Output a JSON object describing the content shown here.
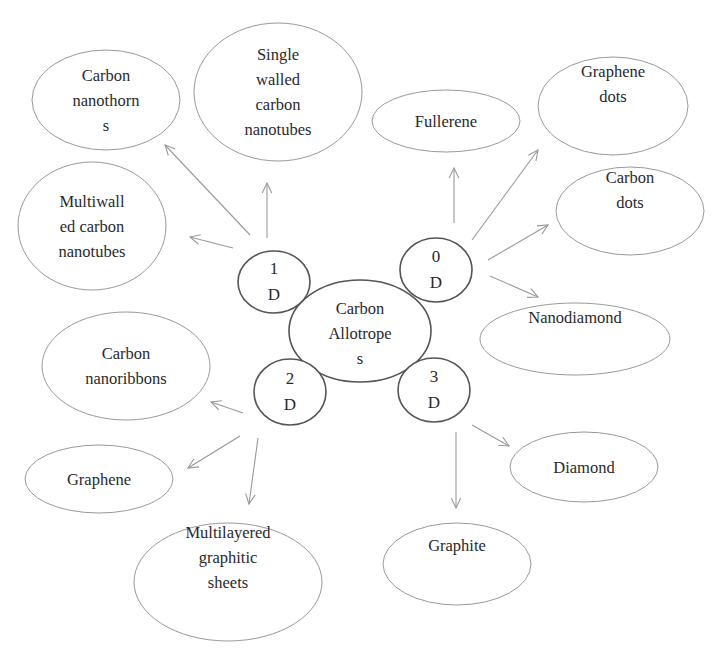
{
  "diagram": {
    "center": {
      "id": "carbon-allotropes",
      "lines": [
        "Carbon",
        "Allotrope",
        "s"
      ],
      "ellipse": {
        "cx": 360,
        "cy": 331,
        "rx": 71,
        "ry": 51
      }
    },
    "dimensions": [
      {
        "id": "1d",
        "lines": [
          "1",
          "D"
        ],
        "ellipse": {
          "cx": 274,
          "cy": 282,
          "rx": 36,
          "ry": 31
        }
      },
      {
        "id": "0d",
        "lines": [
          "0",
          "D"
        ],
        "ellipse": {
          "cx": 436,
          "cy": 270,
          "rx": 36,
          "ry": 32
        }
      },
      {
        "id": "2d",
        "lines": [
          "2",
          "D"
        ],
        "ellipse": {
          "cx": 290,
          "cy": 392,
          "rx": 36,
          "ry": 33
        }
      },
      {
        "id": "3d",
        "lines": [
          "3",
          "D"
        ],
        "ellipse": {
          "cx": 434,
          "cy": 390,
          "rx": 36,
          "ry": 32
        }
      }
    ],
    "allotropes": [
      {
        "id": "carbon-nanothorns",
        "group": "1D",
        "lines": [
          "Carbon",
          "nanothorn",
          "s"
        ],
        "ellipse": {
          "cx": 106,
          "cy": 100,
          "rx": 74,
          "ry": 50
        }
      },
      {
        "id": "single-walled-carbon-nanotubes",
        "group": "1D",
        "lines": [
          "Single",
          "walled",
          "carbon",
          "nanotubes"
        ],
        "ellipse": {
          "cx": 278,
          "cy": 92,
          "rx": 84,
          "ry": 69
        }
      },
      {
        "id": "multiwalled-carbon-nanotubes",
        "group": "1D",
        "lines": [
          "Multiwall",
          "ed carbon",
          "nanotubes"
        ],
        "ellipse": {
          "cx": 92,
          "cy": 226,
          "rx": 74,
          "ry": 64
        }
      },
      {
        "id": "fullerene",
        "group": "0D",
        "lines": [
          "Fullerene"
        ],
        "ellipse": {
          "cx": 446,
          "cy": 121,
          "rx": 74,
          "ry": 31
        }
      },
      {
        "id": "graphene-dots",
        "group": "0D",
        "lines": [
          "Graphene",
          "dots"
        ],
        "ellipse": {
          "cx": 613,
          "cy": 106,
          "rx": 75,
          "ry": 49
        }
      },
      {
        "id": "carbon-dots",
        "group": "0D",
        "lines": [
          "Carbon",
          "dots"
        ],
        "ellipse": {
          "cx": 630,
          "cy": 211,
          "rx": 74,
          "ry": 44
        }
      },
      {
        "id": "nanodiamond",
        "group": "0D",
        "lines": [
          "Nanodiamond"
        ],
        "ellipse": {
          "cx": 575,
          "cy": 339,
          "rx": 95,
          "ry": 36
        }
      },
      {
        "id": "carbon-nanoribbons",
        "group": "2D",
        "lines": [
          "Carbon",
          "nanoribbons"
        ],
        "ellipse": {
          "cx": 126,
          "cy": 366,
          "rx": 84,
          "ry": 54
        }
      },
      {
        "id": "graphene",
        "group": "2D",
        "lines": [
          "Graphene"
        ],
        "ellipse": {
          "cx": 99,
          "cy": 479,
          "rx": 74,
          "ry": 34
        }
      },
      {
        "id": "multilayered-graphitic-sheets",
        "group": "2D",
        "lines": [
          "Multilayered",
          "graphitic",
          "sheets"
        ],
        "ellipse": {
          "cx": 228,
          "cy": 582,
          "rx": 94,
          "ry": 59
        }
      },
      {
        "id": "diamond",
        "group": "3D",
        "lines": [
          "Diamond"
        ],
        "ellipse": {
          "cx": 584,
          "cy": 467,
          "rx": 74,
          "ry": 35
        }
      },
      {
        "id": "graphite",
        "group": "3D",
        "lines": [
          "Graphite"
        ],
        "ellipse": {
          "cx": 457,
          "cy": 564,
          "rx": 74,
          "ry": 41
        }
      }
    ],
    "arrows": [
      {
        "from": "1D",
        "to": "carbon-nanothorns",
        "x1": 250,
        "y1": 235,
        "x2": 165,
        "y2": 145
      },
      {
        "from": "1D",
        "to": "single-walled-carbon-nanotubes",
        "x1": 267,
        "y1": 238,
        "x2": 267,
        "y2": 183
      },
      {
        "from": "1D",
        "to": "multiwalled-carbon-nanotubes",
        "x1": 233,
        "y1": 248,
        "x2": 190,
        "y2": 237
      },
      {
        "from": "0D",
        "to": "fullerene",
        "x1": 454,
        "y1": 223,
        "x2": 454,
        "y2": 168
      },
      {
        "from": "0D",
        "to": "graphene-dots",
        "x1": 472,
        "y1": 240,
        "x2": 538,
        "y2": 150
      },
      {
        "from": "0D",
        "to": "carbon-dots",
        "x1": 488,
        "y1": 260,
        "x2": 548,
        "y2": 225
      },
      {
        "from": "0D",
        "to": "nanodiamond",
        "x1": 490,
        "y1": 276,
        "x2": 538,
        "y2": 297
      },
      {
        "from": "2D",
        "to": "carbon-nanoribbons",
        "x1": 243,
        "y1": 413,
        "x2": 211,
        "y2": 402
      },
      {
        "from": "2D",
        "to": "graphene",
        "x1": 240,
        "y1": 436,
        "x2": 188,
        "y2": 468
      },
      {
        "from": "2D",
        "to": "multilayered-graphitic-sheets",
        "x1": 258,
        "y1": 438,
        "x2": 249,
        "y2": 504
      },
      {
        "from": "3D",
        "to": "diamond",
        "x1": 472,
        "y1": 425,
        "x2": 509,
        "y2": 446
      },
      {
        "from": "3D",
        "to": "graphite",
        "x1": 456,
        "y1": 432,
        "x2": 456,
        "y2": 508
      }
    ],
    "colors": {
      "allotrope_stroke": "#9a9a9a",
      "core_stroke": "#555555",
      "arrow_stroke": "#9a9a9a",
      "text": "#2a2a2a",
      "background": "#ffffff"
    }
  }
}
